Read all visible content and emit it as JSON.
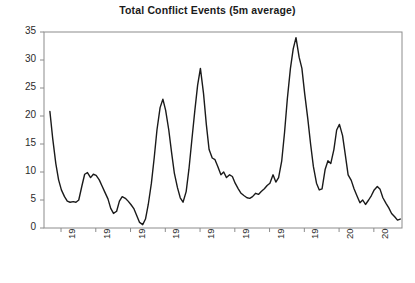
{
  "chart_data": {
    "type": "line",
    "title": "Total Conflict Events (5m average)",
    "xlabel": "",
    "ylabel": "",
    "ylim": [
      0,
      35
    ],
    "yticks": [
      0,
      5,
      10,
      15,
      20,
      25,
      30,
      35
    ],
    "ytick_labels": [
      "0",
      "5",
      "10",
      "15",
      "20",
      "25",
      "30",
      "35"
    ],
    "xtick_labels": [
      "1992",
      "1993",
      "1994",
      "1995",
      "1996",
      "1997",
      "1998",
      "1999",
      "2000",
      "2001"
    ],
    "xlim": [
      1991.55,
      2001.85
    ],
    "grid": false,
    "legend": null,
    "line_color": "#1a1a1a",
    "series_name": "Total Conflict Events (5m average)",
    "x": [
      1991.72,
      1991.8,
      1991.89,
      1991.97,
      1992.05,
      1992.14,
      1992.22,
      1992.3,
      1992.39,
      1992.47,
      1992.55,
      1992.64,
      1992.72,
      1992.8,
      1992.89,
      1992.97,
      1993.05,
      1993.14,
      1993.22,
      1993.3,
      1993.39,
      1993.47,
      1993.55,
      1993.64,
      1993.72,
      1993.8,
      1993.89,
      1993.97,
      1994.05,
      1994.14,
      1994.22,
      1994.3,
      1994.39,
      1994.47,
      1994.55,
      1994.64,
      1994.72,
      1994.8,
      1994.89,
      1994.97,
      1995.05,
      1995.14,
      1995.22,
      1995.3,
      1995.39,
      1995.47,
      1995.55,
      1995.64,
      1995.72,
      1995.8,
      1995.89,
      1995.97,
      1996.05,
      1996.14,
      1996.22,
      1996.3,
      1996.39,
      1996.47,
      1996.55,
      1996.64,
      1996.72,
      1996.8,
      1996.89,
      1996.97,
      1997.05,
      1997.14,
      1997.22,
      1997.3,
      1997.39,
      1997.47,
      1997.55,
      1997.64,
      1997.72,
      1997.8,
      1997.89,
      1997.97,
      1998.05,
      1998.14,
      1998.22,
      1998.3,
      1998.39,
      1998.47,
      1998.55,
      1998.64,
      1998.72,
      1998.8,
      1998.89,
      1998.97,
      1999.05,
      1999.14,
      1999.22,
      1999.3,
      1999.39,
      1999.47,
      1999.55,
      1999.64,
      1999.72,
      1999.8,
      1999.89,
      1999.97,
      2000.05,
      2000.14,
      2000.22,
      2000.3,
      2000.39,
      2000.47,
      2000.55,
      2000.64,
      2000.72,
      2000.8,
      2000.89,
      2000.97,
      2001.05,
      2001.14,
      2001.22,
      2001.3,
      2001.39,
      2001.47,
      2001.55,
      2001.64
    ],
    "values": [
      20.8,
      16.0,
      11.5,
      8.6,
      6.8,
      5.6,
      4.8,
      4.6,
      4.7,
      4.6,
      5.0,
      7.5,
      9.6,
      9.9,
      9.0,
      9.6,
      9.4,
      8.6,
      7.5,
      6.4,
      5.2,
      3.5,
      2.6,
      3.0,
      4.8,
      5.6,
      5.3,
      4.8,
      4.2,
      3.4,
      2.2,
      1.0,
      0.6,
      1.6,
      4.2,
      8.0,
      12.5,
      17.5,
      21.5,
      23.0,
      21.0,
      17.5,
      13.5,
      9.8,
      7.2,
      5.4,
      4.6,
      6.5,
      10.5,
      15.5,
      21.0,
      25.5,
      28.5,
      24.0,
      18.5,
      14.0,
      12.5,
      12.2,
      11.0,
      9.5,
      10.0,
      9.0,
      9.5,
      9.2,
      8.0,
      7.0,
      6.2,
      5.8,
      5.4,
      5.3,
      5.6,
      6.2,
      6.0,
      6.5,
      7.0,
      7.6,
      8.0,
      9.5,
      8.2,
      9.0,
      12.0,
      17.0,
      23.0,
      28.5,
      32.0,
      34.0,
      30.5,
      28.5,
      24.0,
      19.5,
      15.0,
      11.0,
      8.0,
      6.8,
      7.0,
      10.5,
      12.0,
      11.5,
      14.0,
      17.5,
      18.5,
      16.5,
      13.0,
      9.5,
      8.5,
      7.0,
      5.8,
      4.5,
      5.0,
      4.2,
      5.0,
      5.8,
      6.8,
      7.4,
      6.9,
      5.4,
      4.4,
      3.6,
      2.6,
      2.0
    ],
    "tail": {
      "x": [
        2001.72,
        2001.8,
        2001.89,
        2001.97,
        2002.05
      ],
      "values": [
        1.4,
        1.6,
        1.5,
        1.2,
        1.2
      ]
    }
  },
  "plot_geometry": {
    "left": 44,
    "right": 402,
    "top": 32,
    "bottom": 228
  }
}
